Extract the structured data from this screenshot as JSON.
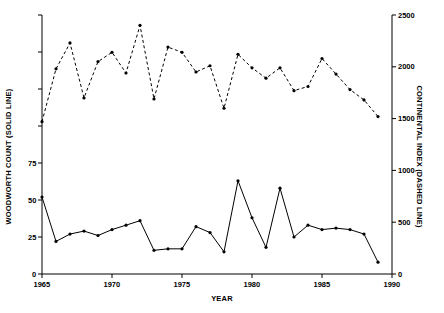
{
  "chart_data": {
    "type": "line",
    "title": "",
    "xlabel": "YEAR",
    "ylabel": "WOODWORTH COUNT (SOLID LINE)",
    "ylabel_right": "CONTINENTAL INDEX (DASHED LINE)",
    "xlim": [
      1965,
      1990
    ],
    "ylim": [
      0,
      175
    ],
    "ylim_right": [
      0,
      2500
    ],
    "grid": false,
    "legend": "none (series identified in axis titles)",
    "xticks": [
      1965,
      1970,
      1975,
      1980,
      1985,
      1990
    ],
    "xtick_labels": [
      "1965",
      "1970",
      "1975",
      "1980",
      "1985",
      "1990"
    ],
    "yticks_left": [
      0,
      25,
      50,
      75,
      100,
      125,
      150,
      175
    ],
    "ytick_labels_left": [
      "0",
      "25",
      "50",
      "75",
      "",
      "",
      "",
      ""
    ],
    "yticks_right": [
      0,
      500,
      1000,
      1500,
      2000,
      2500
    ],
    "ytick_labels_right": [
      "0",
      "500",
      "1000",
      "1500",
      "2000",
      "2500"
    ],
    "x": [
      1965,
      1966,
      1967,
      1968,
      1969,
      1970,
      1971,
      1972,
      1973,
      1974,
      1975,
      1976,
      1977,
      1978,
      1979,
      1980,
      1981,
      1982,
      1983,
      1984,
      1985,
      1986,
      1987,
      1988,
      1989
    ],
    "series": [
      {
        "name": "WOODWORTH COUNT (SOLID LINE)",
        "axis": "left",
        "style": "solid",
        "marker": "filled-circle",
        "color": "#000000",
        "values": [
          52,
          22,
          27,
          29,
          26,
          30,
          33,
          36,
          16,
          17,
          17,
          32,
          28,
          15,
          63,
          38,
          18,
          58,
          25,
          33,
          30,
          31,
          30,
          27,
          8
        ]
      },
      {
        "name": "CONTINENTAL INDEX (DASHED LINE)",
        "axis": "right",
        "style": "dashed",
        "marker": "filled-circle",
        "color": "#000000",
        "values": [
          1470,
          1980,
          2230,
          1700,
          2050,
          2140,
          1940,
          2400,
          1690,
          2190,
          2140,
          1950,
          2010,
          1600,
          2120,
          1990,
          1890,
          1990,
          1770,
          1810,
          2080,
          1930,
          1780,
          1680,
          1520
        ]
      }
    ]
  }
}
